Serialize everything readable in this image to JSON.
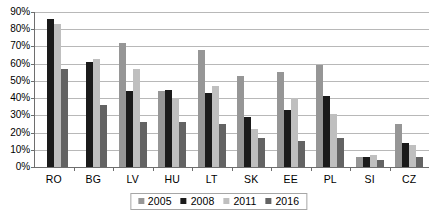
{
  "chart_data": {
    "type": "bar",
    "title": "",
    "subtitle": "",
    "xlabel": "",
    "ylabel": "",
    "ylim": [
      0,
      90
    ],
    "ytick_step": 10,
    "ytick_labels": [
      "0%",
      "10%",
      "20%",
      "30%",
      "40%",
      "50%",
      "60%",
      "70%",
      "80%",
      "90%"
    ],
    "ytick_values": [
      0,
      10,
      20,
      30,
      40,
      50,
      60,
      70,
      80,
      90
    ],
    "grid": true,
    "grid_axis": "y",
    "legend_position": "bottom-center",
    "categories": [
      "RO",
      "BG",
      "LV",
      "HU",
      "LT",
      "SK",
      "EE",
      "PL",
      "SI",
      "CZ"
    ],
    "series": [
      {
        "name": "2005",
        "color": "#969696",
        "values": [
          null,
          null,
          72,
          44,
          68,
          53,
          55,
          59,
          6,
          25
        ]
      },
      {
        "name": "2008",
        "color": "#1a1a1a",
        "values": [
          86,
          61,
          44,
          45,
          43,
          29,
          33,
          41,
          6,
          14
        ]
      },
      {
        "name": "2011",
        "color": "#bfbfbf",
        "values": [
          83,
          63,
          57,
          40,
          47,
          22,
          40,
          31,
          7,
          13
        ]
      },
      {
        "name": "2016",
        "color": "#636363",
        "values": [
          57,
          36,
          26,
          26,
          25,
          17,
          15,
          17,
          4,
          6
        ]
      }
    ]
  },
  "colors": {
    "axis": "#6e6e6e",
    "gridline": "#b8b8b8",
    "text": "#000000",
    "background": "#ffffff",
    "legend_border": "#a6a6a6"
  }
}
